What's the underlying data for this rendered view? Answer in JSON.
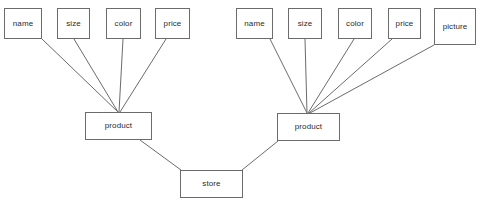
{
  "diagram": {
    "background_color": "#ffffff",
    "line_color": "#6b6b6b",
    "text_color": "#2b2b2b",
    "nodes": [
      {
        "id": "l-name",
        "label": "name",
        "x": 4,
        "y": 8,
        "w": 38,
        "h": 31
      },
      {
        "id": "l-size",
        "label": "size",
        "x": 57,
        "y": 8,
        "w": 33,
        "h": 31
      },
      {
        "id": "l-color",
        "label": "color",
        "x": 106,
        "y": 8,
        "w": 35,
        "h": 31
      },
      {
        "id": "l-price",
        "label": "price",
        "x": 155,
        "y": 8,
        "w": 35,
        "h": 31
      },
      {
        "id": "r-name",
        "label": "name",
        "x": 236,
        "y": 8,
        "w": 37,
        "h": 31
      },
      {
        "id": "r-size",
        "label": "size",
        "x": 288,
        "y": 8,
        "w": 34,
        "h": 31
      },
      {
        "id": "r-color",
        "label": "color",
        "x": 338,
        "y": 8,
        "w": 34,
        "h": 31
      },
      {
        "id": "r-price",
        "label": "price",
        "x": 388,
        "y": 8,
        "w": 33,
        "h": 31
      },
      {
        "id": "r-picture",
        "label": "picture",
        "x": 434,
        "y": 8,
        "w": 42,
        "h": 37
      },
      {
        "id": "l-product",
        "label": "product",
        "x": 85,
        "y": 112,
        "w": 67,
        "h": 28
      },
      {
        "id": "r-product",
        "label": "product",
        "x": 277,
        "y": 113,
        "w": 63,
        "h": 28
      },
      {
        "id": "store",
        "label": "store",
        "x": 180,
        "y": 170,
        "w": 63,
        "h": 28
      }
    ],
    "edges": [
      {
        "from": "l-name",
        "to": "l-product",
        "x1": 42,
        "y1": 39,
        "x2": 118,
        "y2": 112
      },
      {
        "from": "l-size",
        "to": "l-product",
        "x1": 74,
        "y1": 39,
        "x2": 118,
        "y2": 112
      },
      {
        "from": "l-color",
        "to": "l-product",
        "x1": 123,
        "y1": 39,
        "x2": 119,
        "y2": 112
      },
      {
        "from": "l-price",
        "to": "l-product",
        "x1": 166,
        "y1": 39,
        "x2": 120,
        "y2": 112
      },
      {
        "from": "r-name",
        "to": "r-product",
        "x1": 270,
        "y1": 39,
        "x2": 307,
        "y2": 113
      },
      {
        "from": "r-size",
        "to": "r-product",
        "x1": 305,
        "y1": 39,
        "x2": 307,
        "y2": 113
      },
      {
        "from": "r-color",
        "to": "r-product",
        "x1": 354,
        "y1": 39,
        "x2": 308,
        "y2": 113
      },
      {
        "from": "r-price",
        "to": "r-product",
        "x1": 392,
        "y1": 39,
        "x2": 309,
        "y2": 113
      },
      {
        "from": "r-picture",
        "to": "r-product",
        "x1": 434,
        "y1": 45,
        "x2": 310,
        "y2": 113
      },
      {
        "from": "l-product",
        "to": "store",
        "x1": 140,
        "y1": 140,
        "x2": 181,
        "y2": 170
      },
      {
        "from": "r-product",
        "to": "store",
        "x1": 278,
        "y1": 141,
        "x2": 242,
        "y2": 170
      }
    ]
  }
}
